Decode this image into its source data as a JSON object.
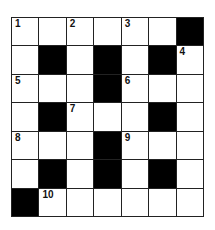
{
  "puzzle": {
    "rows": 7,
    "cols": 7,
    "colors": {
      "block": "#000000",
      "cell": "#ffffff",
      "line": "#222222"
    },
    "grid": [
      [
        {
          "n": "1"
        },
        {},
        {
          "n": "2"
        },
        {},
        {
          "n": "3"
        },
        {},
        {
          "b": true
        }
      ],
      [
        {},
        {
          "b": true
        },
        {},
        {
          "b": true
        },
        {},
        {
          "b": true
        },
        {
          "n": "4"
        }
      ],
      [
        {
          "n": "5"
        },
        {},
        {},
        {
          "b": true
        },
        {
          "n": "6"
        },
        {},
        {}
      ],
      [
        {},
        {
          "b": true
        },
        {
          "n": "7"
        },
        {},
        {},
        {
          "b": true
        },
        {}
      ],
      [
        {
          "n": "8"
        },
        {},
        {},
        {
          "b": true
        },
        {
          "n": "9"
        },
        {},
        {}
      ],
      [
        {},
        {
          "b": true
        },
        {},
        {
          "b": true
        },
        {},
        {
          "b": true
        },
        {}
      ],
      [
        {
          "b": true
        },
        {
          "n": "10"
        },
        {},
        {},
        {},
        {},
        {}
      ]
    ]
  }
}
